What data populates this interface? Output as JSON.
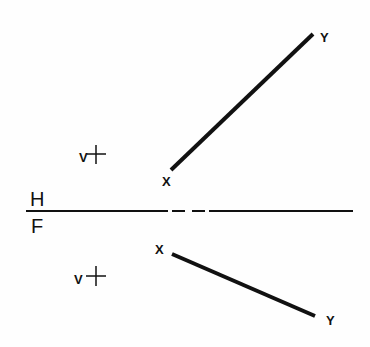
{
  "drawing": {
    "title": "Line XY in horizontal and frontal views",
    "fold_line": {
      "upper_label": "H",
      "lower_label": "F",
      "y": 211,
      "x_start": 26,
      "x_end": 353,
      "segments": [
        [
          26,
          168
        ],
        [
          172,
          185
        ],
        [
          192,
          205
        ],
        [
          209,
          353
        ]
      ]
    },
    "horizontal_view": {
      "point_x": {
        "label": "X",
        "pos": [
          171,
          170
        ],
        "label_pos": [
          163,
          185
        ]
      },
      "point_y": {
        "label": "Y",
        "pos": [
          313,
          34
        ],
        "label_pos": [
          323,
          41
        ]
      },
      "marker": {
        "label": "V",
        "cross": [
          96,
          154
        ],
        "label_pos": [
          81,
          161
        ]
      }
    },
    "frontal_view": {
      "point_x": {
        "label": "X",
        "pos": [
          172,
          254
        ],
        "label_pos": [
          158,
          252
        ]
      },
      "point_y": {
        "label": "Y",
        "pos": [
          315,
          316
        ],
        "label_pos": [
          329,
          324
        ]
      },
      "marker": {
        "label": "V",
        "cross": [
          96,
          276
        ],
        "label_pos": [
          76,
          283
        ]
      }
    },
    "colors": {
      "ink": "#111111",
      "paper": "#fefefe"
    }
  }
}
